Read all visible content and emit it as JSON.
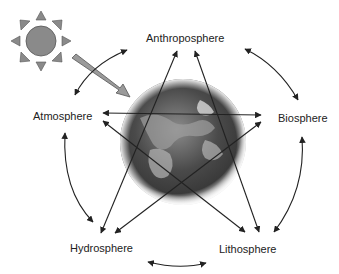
{
  "diagram": {
    "title": "",
    "nodes": [
      {
        "id": "anthroposphere",
        "label": "Anthroposphere"
      },
      {
        "id": "atmosphere",
        "label": "Atmosphere"
      },
      {
        "id": "biosphere",
        "label": "Biosphere"
      },
      {
        "id": "hydrosphere",
        "label": "Hydrosphere"
      },
      {
        "id": "lithosphere",
        "label": "Lithosphere"
      }
    ],
    "edges": [
      {
        "from": "atmosphere",
        "to": "anthroposphere",
        "type": "curved-bidirectional"
      },
      {
        "from": "anthroposphere",
        "to": "biosphere",
        "type": "curved-bidirectional"
      },
      {
        "from": "biosphere",
        "to": "lithosphere",
        "type": "curved-bidirectional"
      },
      {
        "from": "lithosphere",
        "to": "hydrosphere",
        "type": "curved-bidirectional"
      },
      {
        "from": "hydrosphere",
        "to": "atmosphere",
        "type": "curved-bidirectional"
      },
      {
        "from": "atmosphere",
        "to": "biosphere",
        "type": "straight-bidirectional"
      },
      {
        "from": "atmosphere",
        "to": "lithosphere",
        "type": "straight-bidirectional"
      },
      {
        "from": "anthroposphere",
        "to": "hydrosphere",
        "type": "straight-bidirectional"
      },
      {
        "from": "anthroposphere",
        "to": "lithosphere",
        "type": "straight-bidirectional"
      },
      {
        "from": "biosphere",
        "to": "hydrosphere",
        "type": "straight-bidirectional"
      }
    ],
    "icons": {
      "sun": "sun-icon",
      "earth": "earth-globe",
      "solar_arrow": "solar-radiation-arrow"
    },
    "colors": {
      "sun_fill": "#8a8a8a",
      "arrow": "#222222",
      "solar_arrow_fill": "#9a9a9a",
      "earth_dark": "#2e2e2e",
      "earth_light": "#bdbdbd"
    }
  }
}
